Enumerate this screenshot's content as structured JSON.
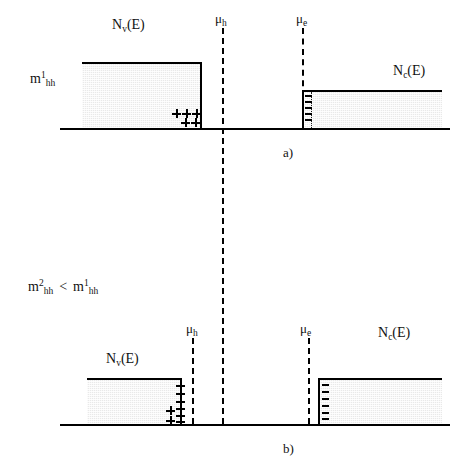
{
  "figure": {
    "background_color": "#ffffff",
    "line_color": "#000000",
    "band_fill_color": "#e9e9e9"
  },
  "panel_a": {
    "caption": "a)",
    "mass_label": {
      "base": "m",
      "superscript": "1",
      "subscript": "hh"
    },
    "valence_label": {
      "base": "N",
      "subscript": "v",
      "suffix": "(E)"
    },
    "conduction_label": {
      "base": "N",
      "subscript": "c",
      "suffix": "(E)"
    },
    "mu_hole_label": {
      "base": "μ",
      "subscript": "h"
    },
    "mu_electron_label": {
      "base": "μ",
      "subscript": "e"
    },
    "valence_box": {
      "x": 82,
      "y": 62,
      "width": 120,
      "height": 66
    },
    "conduction_box": {
      "x": 302,
      "y": 90,
      "width": 140,
      "height": 38
    },
    "baseline": {
      "x": 60,
      "y": 128,
      "width": 390
    },
    "mu_hole_line": {
      "x": 222,
      "y_top": 28,
      "y_bottom": 150
    },
    "mu_electron_line": {
      "x": 302,
      "y_top": 28,
      "y_bottom": 128
    },
    "dotted_line": {
      "x": 311,
      "y_top": 92,
      "y_bottom": 128
    },
    "plus_rows": [
      {
        "y": 113,
        "xs": [
          172,
          182,
          192
        ]
      },
      {
        "y": 121,
        "xs": [
          181,
          191
        ]
      }
    ],
    "minus_marks": {
      "x": 305,
      "ys": [
        95,
        101,
        107,
        113,
        119
      ],
      "count": 5
    }
  },
  "panel_b": {
    "caption": "b)",
    "mass_comparison": {
      "left": {
        "base": "m",
        "superscript": "2",
        "subscript": "hh"
      },
      "operator": "<",
      "right": {
        "base": "m",
        "superscript": "1",
        "subscript": "hh"
      }
    },
    "valence_label": {
      "base": "N",
      "subscript": "v",
      "suffix": "(E)"
    },
    "conduction_label": {
      "base": "N",
      "subscript": "c",
      "suffix": "(E)"
    },
    "mu_hole_label": {
      "base": "μ",
      "subscript": "h"
    },
    "mu_electron_label": {
      "base": "μ",
      "subscript": "e"
    },
    "valence_box": {
      "x": 87,
      "y": 378,
      "width": 95,
      "height": 46
    },
    "conduction_box": {
      "x": 318,
      "y": 378,
      "width": 124,
      "height": 46
    },
    "baseline": {
      "x": 60,
      "y": 424,
      "width": 390
    },
    "mu_hole_line": {
      "x": 192,
      "y_top": 338,
      "y_bottom": 424
    },
    "mu_electron_line": {
      "x": 308,
      "y_top": 338,
      "y_bottom": 424
    },
    "center_line": {
      "x": 222,
      "y_top": 28,
      "y_bottom": 424
    },
    "plus_column": {
      "x": 176,
      "ys": [
        382,
        390,
        398,
        406,
        412,
        418
      ]
    },
    "plus_extra": {
      "x": 166,
      "ys": [
        406,
        416
      ]
    },
    "minus_marks": {
      "x": 321,
      "ys": [
        384,
        391,
        398,
        405,
        412,
        418
      ],
      "count": 6
    }
  }
}
